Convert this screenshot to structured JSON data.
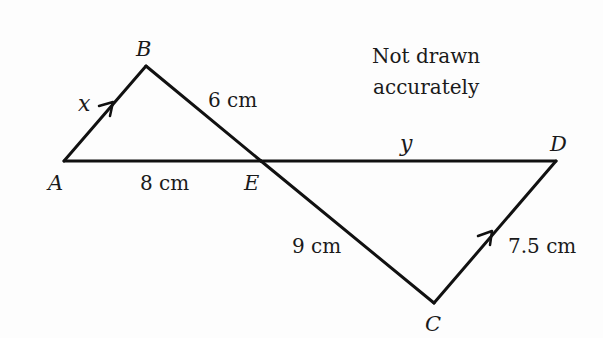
{
  "diagram": {
    "note": [
      "Not drawn",
      "accurately"
    ],
    "vertices": {
      "A": {
        "label": "A",
        "x": 64,
        "y": 161
      },
      "B": {
        "label": "B",
        "x": 146,
        "y": 66
      },
      "E": {
        "label": "E",
        "x": 261,
        "y": 161
      },
      "D": {
        "label": "D",
        "x": 556,
        "y": 161
      },
      "C": {
        "label": "C",
        "x": 434,
        "y": 303
      }
    },
    "segments": [
      {
        "from": "A",
        "to": "B",
        "label": "x",
        "parallel_arrow": true
      },
      {
        "from": "B",
        "to": "E",
        "label": "6 cm"
      },
      {
        "from": "A",
        "to": "E",
        "label": "8 cm"
      },
      {
        "from": "E",
        "to": "D",
        "label": "y"
      },
      {
        "from": "E",
        "to": "C",
        "label": "9 cm"
      },
      {
        "from": "C",
        "to": "D",
        "label": "7.5 cm",
        "parallel_arrow": true
      }
    ],
    "labels": {
      "x": "x",
      "y": "y",
      "be": "6 cm",
      "ae": "8 cm",
      "ec": "9 cm",
      "cd": "7.5 cm"
    },
    "colors": {
      "line": "#111111",
      "text": "#1a1a1a",
      "background": "#fdfdfd"
    }
  }
}
